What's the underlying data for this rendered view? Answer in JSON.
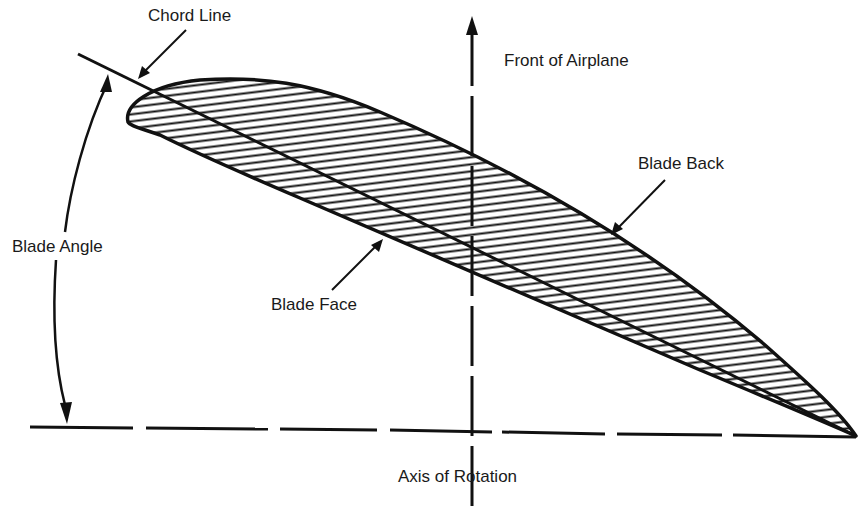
{
  "diagram": {
    "labels": {
      "chord_line": "Chord Line",
      "front_of_airplane": "Front of Airplane",
      "blade_back": "Blade Back",
      "blade_angle": "Blade Angle",
      "blade_face": "Blade Face",
      "axis_of_rotation": "Axis of Rotation"
    },
    "colors": {
      "ink": "#111111",
      "background": "#ffffff"
    }
  }
}
